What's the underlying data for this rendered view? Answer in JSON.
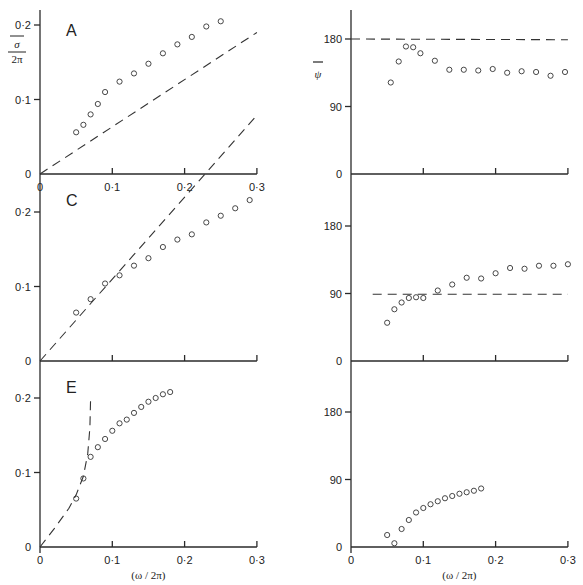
{
  "chart_data": [
    {
      "type": "scatter",
      "panel": "A",
      "position": "top-left",
      "ylabel": "σ̄ / 2π",
      "xlabel": "",
      "xlim": [
        0,
        0.3
      ],
      "ylim": [
        0,
        0.2
      ],
      "xticks": [
        "0",
        "0·1",
        "0·2",
        "0·3"
      ],
      "yticks": [
        "0",
        "0·1",
        "0·2"
      ],
      "series": [
        {
          "name": "measured",
          "style": "circles",
          "x": [
            0.05,
            0.06,
            0.07,
            0.08,
            0.09,
            0.11,
            0.13,
            0.15,
            0.17,
            0.19,
            0.21,
            0.23,
            0.25,
            0.27,
            0.29
          ],
          "y": [
            0.056,
            0.066,
            0.08,
            0.094,
            0.11,
            0.124,
            0.135,
            0.148,
            0.162,
            0.174,
            0.184,
            0.198,
            0.205,
            0,
            0
          ]
        },
        {
          "name": "theory",
          "style": "dashed",
          "x": [
            0,
            0.3
          ],
          "y": [
            0,
            0.19
          ]
        }
      ]
    },
    {
      "type": "scatter",
      "panel": "B",
      "position": "top-right",
      "ylabel": "ψ̄",
      "xlim": [
        0,
        0.3
      ],
      "ylim": [
        0,
        200
      ],
      "xticks": [
        "",
        "",
        "",
        ""
      ],
      "yticks": [
        "0",
        "90",
        "180"
      ],
      "series": [
        {
          "name": "measured",
          "style": "circles",
          "x": [
            0.055,
            0.066,
            0.076,
            0.086,
            0.096,
            0.116,
            0.136,
            0.156,
            0.176,
            0.196,
            0.216,
            0.236,
            0.256,
            0.276,
            0.296
          ],
          "y": [
            122,
            150,
            170,
            169,
            161,
            151,
            139,
            139,
            138,
            140,
            135,
            137,
            136,
            131,
            136
          ]
        },
        {
          "name": "theory",
          "style": "dashed",
          "x": [
            0,
            0.3
          ],
          "y": [
            180,
            179
          ]
        }
      ]
    },
    {
      "type": "scatter",
      "panel": "C",
      "position": "middle-left",
      "xlim": [
        0,
        0.3
      ],
      "ylim": [
        0,
        0.25
      ],
      "xticks": [
        "",
        "",
        "",
        ""
      ],
      "yticks": [
        "0",
        "0·1",
        "0·2"
      ],
      "series": [
        {
          "name": "measured",
          "style": "circles",
          "x": [
            0.05,
            0.07,
            0.09,
            0.11,
            0.13,
            0.15,
            0.17,
            0.19,
            0.21,
            0.23,
            0.25,
            0.27,
            0.29,
            0.3
          ],
          "y": [
            0.065,
            0.083,
            0.104,
            0.115,
            0.128,
            0.138,
            0.153,
            0.163,
            0.17,
            0.186,
            0.195,
            0.205,
            0.216,
            0
          ]
        },
        {
          "name": "theory",
          "style": "dashed",
          "x": [
            0,
            0.3
          ],
          "y": [
            0,
            0.33
          ]
        }
      ]
    },
    {
      "type": "scatter",
      "panel": "D",
      "position": "middle-right",
      "xlim": [
        0,
        0.3
      ],
      "ylim": [
        0,
        200
      ],
      "xticks": [
        "",
        "",
        "",
        ""
      ],
      "yticks": [
        "0",
        "90",
        "180"
      ],
      "series": [
        {
          "name": "measured",
          "style": "circles",
          "x": [
            0.05,
            0.06,
            0.07,
            0.08,
            0.09,
            0.1,
            0.12,
            0.14,
            0.16,
            0.18,
            0.2,
            0.22,
            0.24,
            0.26,
            0.28,
            0.3
          ],
          "y": [
            51,
            69,
            78,
            84,
            85,
            84,
            94,
            102,
            111,
            110,
            117,
            124,
            123,
            127,
            127,
            129
          ]
        },
        {
          "name": "theory",
          "style": "dashed",
          "x": [
            0.03,
            0.3
          ],
          "y": [
            89,
            89
          ]
        }
      ]
    },
    {
      "type": "scatter",
      "panel": "E",
      "position": "bottom-left",
      "xlabel": "(ω / 2π)",
      "xlim": [
        0,
        0.3
      ],
      "ylim": [
        0,
        0.25
      ],
      "xticks": [
        "0",
        "0·1",
        "0·2",
        "0·3"
      ],
      "yticks": [
        "0",
        "0·1",
        "0·2"
      ],
      "series": [
        {
          "name": "measured",
          "style": "circles",
          "x": [
            0.05,
            0.06,
            0.07,
            0.08,
            0.09,
            0.1,
            0.11,
            0.12,
            0.13,
            0.14,
            0.15,
            0.16,
            0.17,
            0.18
          ],
          "y": [
            0.065,
            0.092,
            0.121,
            0.134,
            0.145,
            0.156,
            0.166,
            0.171,
            0.18,
            0.188,
            0.195,
            0.2,
            0.205,
            0.208
          ]
        },
        {
          "name": "theory",
          "style": "dashed",
          "x": [
            0,
            0.02,
            0.04,
            0.05,
            0.06,
            0.066,
            0.069,
            0.07
          ],
          "y": [
            0,
            0.025,
            0.052,
            0.07,
            0.095,
            0.125,
            0.16,
            0.2
          ]
        }
      ]
    },
    {
      "type": "scatter",
      "panel": "F",
      "position": "bottom-right",
      "xlabel": "(ω / 2π)",
      "xlim": [
        0,
        0.3
      ],
      "ylim": [
        0,
        200
      ],
      "xticks": [
        "0",
        "0·1",
        "0·2",
        "0·3"
      ],
      "yticks": [
        "0",
        "90",
        "180"
      ],
      "series": [
        {
          "name": "measured",
          "style": "circles",
          "x": [
            0.05,
            0.06,
            0.07,
            0.08,
            0.09,
            0.1,
            0.11,
            0.12,
            0.13,
            0.14,
            0.15,
            0.16,
            0.17,
            0.18
          ],
          "y": [
            16,
            5,
            24,
            36,
            46,
            52,
            57,
            61,
            65,
            68,
            71,
            73,
            75,
            78
          ]
        }
      ]
    }
  ],
  "labels": {
    "panel_A": "A",
    "panel_C": "C",
    "panel_E": "E",
    "ylabel_left_num": "σ",
    "ylabel_left_den": "2π",
    "ylabel_right": "ψ",
    "xlabel": "(ω / 2π)"
  }
}
